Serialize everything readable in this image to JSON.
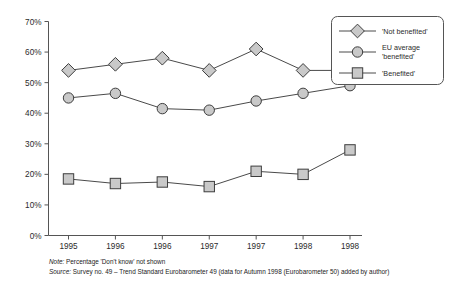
{
  "chart_data": {
    "type": "line",
    "title": "",
    "xlabel": "",
    "ylabel": "",
    "categories": [
      "1995",
      "1996",
      "1996",
      "1997",
      "1997",
      "1998",
      "1998"
    ],
    "ylim": [
      0,
      70
    ],
    "ytick_labels": [
      "0%",
      "10%",
      "20%",
      "30%",
      "40%",
      "50%",
      "60%",
      "70%"
    ],
    "ytick_values": [
      0,
      10,
      20,
      30,
      40,
      50,
      60,
      70
    ],
    "grid": false,
    "legend_position": "top-right",
    "series": [
      {
        "name": "'Not benefited'",
        "marker": "diamond",
        "values": [
          54.0,
          56.0,
          58.0,
          54.0,
          61.0,
          54.0,
          54.0
        ]
      },
      {
        "name": "EU average 'benefited'",
        "marker": "circle",
        "values": [
          45.0,
          46.5,
          41.5,
          41.0,
          44.0,
          46.5,
          49.0
        ]
      },
      {
        "name": "'Benefited'",
        "marker": "square",
        "values": [
          18.5,
          17.0,
          17.5,
          16.0,
          21.0,
          20.0,
          28.0
        ]
      }
    ],
    "colors": {
      "marker_fill": "#c9c9c9",
      "marker_stroke": "#3d3d3d",
      "line": "#4a4a4a",
      "axis": "#555555",
      "text": "#2b2b2b",
      "background": "#ffffff"
    }
  },
  "legend": {
    "entries": [
      {
        "label": "'Not benefited'",
        "marker": "diamond"
      },
      {
        "label_line1": "EU average",
        "label_line2": "'benefited'",
        "marker": "circle"
      },
      {
        "label": "'Benefited'",
        "marker": "square"
      }
    ]
  },
  "footnotes": {
    "note_lead": "Note:",
    "note_text": " Percentage 'Don't know' not shown",
    "source_lead": "Source:",
    "source_text": " Survey no. 49 – Trend Standard Eurobarometer 49 (data for Autumn 1998 (Eurobarometer 50) added by author)"
  }
}
